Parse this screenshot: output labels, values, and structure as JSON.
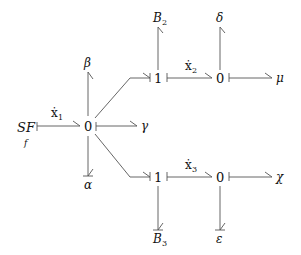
{
  "diagram": {
    "type": "bond-graph",
    "nodes": {
      "source": {
        "label": "SF",
        "sub": "f"
      },
      "junction0_main": {
        "label": "0"
      },
      "junction1_top": {
        "label": "1"
      },
      "junction0_top": {
        "label": "0"
      },
      "junction1_bot": {
        "label": "1"
      },
      "junction0_bot": {
        "label": "0"
      },
      "B2": {
        "label": "B",
        "sub": "2"
      },
      "B3": {
        "label": "B",
        "sub": "3"
      },
      "delta": {
        "label": "δ"
      },
      "mu": {
        "label": "μ"
      },
      "beta": {
        "label": "β"
      },
      "gamma": {
        "label": "γ"
      },
      "alpha": {
        "label": "α"
      },
      "chi": {
        "label": "χ"
      },
      "epsilon": {
        "label": "ε"
      }
    },
    "bond_labels": {
      "x1": {
        "label": "ẋ",
        "sub": "1"
      },
      "x2": {
        "label": "ẋ",
        "sub": "2"
      },
      "x3": {
        "label": "ẋ",
        "sub": "3"
      }
    },
    "colors": {
      "line": "#555555",
      "text": "#111111",
      "background": "#ffffff"
    }
  }
}
